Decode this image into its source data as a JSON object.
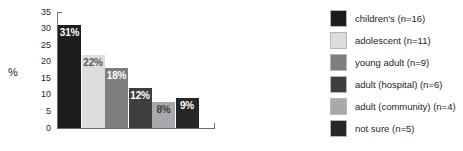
{
  "chart_data": {
    "type": "bar",
    "title": "",
    "subtitle": "",
    "xlabel": "",
    "ylabel": "%",
    "ylim": [
      0,
      35
    ],
    "yticks": [
      "0",
      "5",
      "10",
      "15",
      "20",
      "25",
      "30",
      "35"
    ],
    "grid": false,
    "legend_position": "right",
    "categories": [
      "children's (n=16)",
      "adolescent (n=11)",
      "young adult (n=9)",
      "adult (hospital) (n=6)",
      "adult (community) (n=4)",
      "not sure (n=5)"
    ],
    "values": [
      31,
      22,
      18,
      12,
      8,
      9
    ],
    "data_labels": [
      "31%",
      "22%",
      "18%",
      "12%",
      "8%",
      "9%"
    ],
    "colors": [
      "#1d1d1d",
      "#dcdddd",
      "#7d7e80",
      "#3d3e40",
      "#a7a9ac",
      "#272728"
    ],
    "label_colors": [
      "#ffffff",
      "#58595b",
      "#ffffff",
      "#ffffff",
      "#3d3e40",
      "#ffffff"
    ]
  },
  "legend": {
    "items": [
      {
        "label": "children's (n=16)",
        "color": "#1d1d1d"
      },
      {
        "label": "adolescent (n=11)",
        "color": "#dcdddd"
      },
      {
        "label": "young adult (n=9)",
        "color": "#7d7e80"
      },
      {
        "label": "adult (hospital) (n=6)",
        "color": "#3d3e40"
      },
      {
        "label": "adult (community) (n=4)",
        "color": "#a7a9ac"
      },
      {
        "label": "not sure (n=5)",
        "color": "#272728"
      }
    ]
  },
  "axis": {
    "y_title": "%"
  }
}
